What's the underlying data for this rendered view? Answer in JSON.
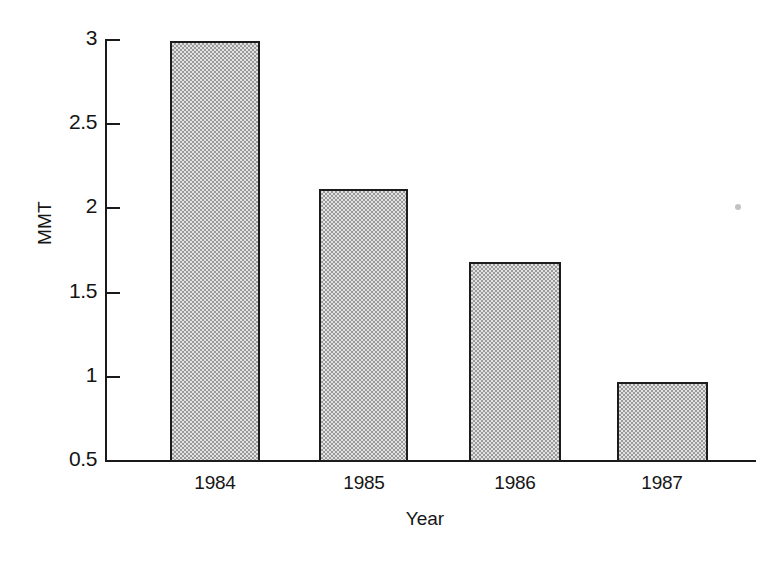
{
  "chart_data": {
    "type": "bar",
    "title": "",
    "xlabel": "Year",
    "ylabel": "MMT",
    "categories": [
      "1984",
      "1985",
      "1986",
      "1987"
    ],
    "values": [
      2.99,
      2.11,
      1.68,
      0.97
    ],
    "ylim": [
      0.5,
      3
    ],
    "yticks": [
      0.5,
      1,
      1.5,
      2,
      2.5,
      3
    ],
    "ytick_labels": [
      "0.5",
      "1",
      "1.5",
      "2",
      "2.5",
      "3"
    ],
    "xtick_labels": [
      "1984",
      "1985",
      "1986",
      "1987"
    ],
    "grid": false,
    "legend": null,
    "bar_fill": "#e2e2e2",
    "bar_pattern": "checkerboard-dither",
    "bar_edge_color": "#1c1c1c",
    "axis_color": "#1a1a1a",
    "background": "#ffffff",
    "annotations": []
  },
  "figure": {
    "speck_name": "scan-artifact-dot"
  }
}
